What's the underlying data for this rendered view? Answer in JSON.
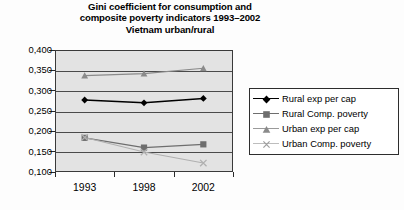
{
  "chart_data": {
    "type": "line",
    "title": "Gini coefficient for consumption and composite poverty indicators 1993–2002 Vietnam urban/rural",
    "title_lines": [
      "Gini coefficient for consumption and",
      "composite poverty indicators 1993–2002",
      "Vietnam urban/rural"
    ],
    "categories": [
      "1993",
      "1998",
      "2002"
    ],
    "x": [
      1993,
      1998,
      2002
    ],
    "xlabel": "",
    "ylabel": "",
    "ylim": [
      0.1,
      0.4
    ],
    "ytick_labels": [
      "0,400",
      "0,350",
      "0,300",
      "0,250",
      "0,200",
      "0,150",
      "0,100"
    ],
    "ytick_values": [
      0.4,
      0.35,
      0.3,
      0.25,
      0.2,
      0.15,
      0.1
    ],
    "decimal_separator": ",",
    "grid": true,
    "grid_axis": "y",
    "legend_position": "right",
    "plot_background": "#e3e3e3",
    "series": [
      {
        "name": "Rural exp per cap",
        "values": [
          0.277,
          0.27,
          0.281
        ],
        "marker": "diamond",
        "color": "#000000"
      },
      {
        "name": "Rural Comp. poverty",
        "values": [
          0.184,
          0.16,
          0.168
        ],
        "marker": "square",
        "color": "#6e6e6e"
      },
      {
        "name": "Urban exp per cap",
        "values": [
          0.337,
          0.342,
          0.355
        ],
        "marker": "triangle",
        "color": "#8a8a8a"
      },
      {
        "name": "Urban Comp. poverty",
        "values": [
          0.185,
          0.149,
          0.122
        ],
        "marker": "cross",
        "color": "#b0b0b0"
      }
    ]
  },
  "legend": {
    "items": [
      {
        "label": "Rural exp per cap"
      },
      {
        "label": "Rural Comp. poverty"
      },
      {
        "label": "Urban exp per cap"
      },
      {
        "label": "Urban Comp. poverty"
      }
    ]
  }
}
